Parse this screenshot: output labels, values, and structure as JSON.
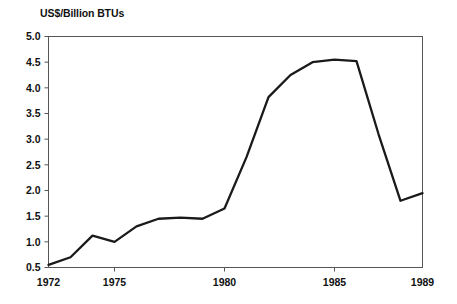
{
  "chart_data": {
    "type": "line",
    "title": "US$/Billion BTUs",
    "xlabel": "",
    "ylabel": "US$/Billion BTUs",
    "x": [
      1972,
      1973,
      1974,
      1975,
      1976,
      1977,
      1978,
      1979,
      1980,
      1981,
      1982,
      1983,
      1984,
      1985,
      1986,
      1987,
      1988,
      1989
    ],
    "values": [
      0.55,
      0.7,
      1.12,
      1.0,
      1.3,
      1.45,
      1.47,
      1.45,
      1.65,
      2.65,
      3.82,
      4.25,
      4.5,
      4.55,
      4.52,
      3.1,
      1.8,
      1.95
    ],
    "series": [
      {
        "name": "US$/Billion BTUs",
        "values": [
          0.55,
          0.7,
          1.12,
          1.0,
          1.3,
          1.45,
          1.47,
          1.45,
          1.65,
          2.65,
          3.82,
          4.25,
          4.5,
          4.55,
          4.52,
          3.1,
          1.8,
          1.95
        ]
      }
    ],
    "xlim": [
      1972,
      1989
    ],
    "ylim": [
      0.5,
      5.0
    ],
    "ytick_labels": [
      "5.0",
      "4.5",
      "4.0",
      "3.5",
      "3.0",
      "2.5",
      "2.0",
      "1.5",
      "1.0",
      "0.5"
    ],
    "ytick_values": [
      5.0,
      4.5,
      4.0,
      3.5,
      3.0,
      2.5,
      2.0,
      1.5,
      1.0,
      0.5
    ],
    "xtick_labels": [
      "1972",
      "1975",
      "1980",
      "1985",
      "1989"
    ],
    "xtick_values": [
      1972,
      1975,
      1980,
      1985,
      1989
    ],
    "grid": false,
    "legend": false,
    "line_color": "#1a1a1a",
    "axis_color": "#555555"
  }
}
